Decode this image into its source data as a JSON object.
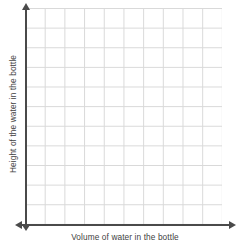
{
  "chart_data": {
    "type": "scatter",
    "title": "",
    "subtitle": "",
    "xlabel": "Volume of water in the bottle",
    "ylabel": "Height of the water in the bottle",
    "x": [],
    "y": [],
    "series": [],
    "annotations": [],
    "legend": [],
    "legend_position": "none",
    "grid": true,
    "xticklabels": [],
    "yticklabels": [],
    "xlim": [
      0,
      10
    ],
    "ylim": [
      0,
      11
    ],
    "grid_columns": 10,
    "grid_rows": 11,
    "note": "Empty coordinate grid with no plotted data points"
  },
  "axes": {
    "x_label": "Volume of water in the bottle",
    "y_label": "Height of the water in the bottle"
  },
  "colors": {
    "grid_line": "#d9d9d9",
    "axis_line": "#4a4a4a",
    "label_text": "#3f3f3f",
    "background": "#ffffff"
  }
}
